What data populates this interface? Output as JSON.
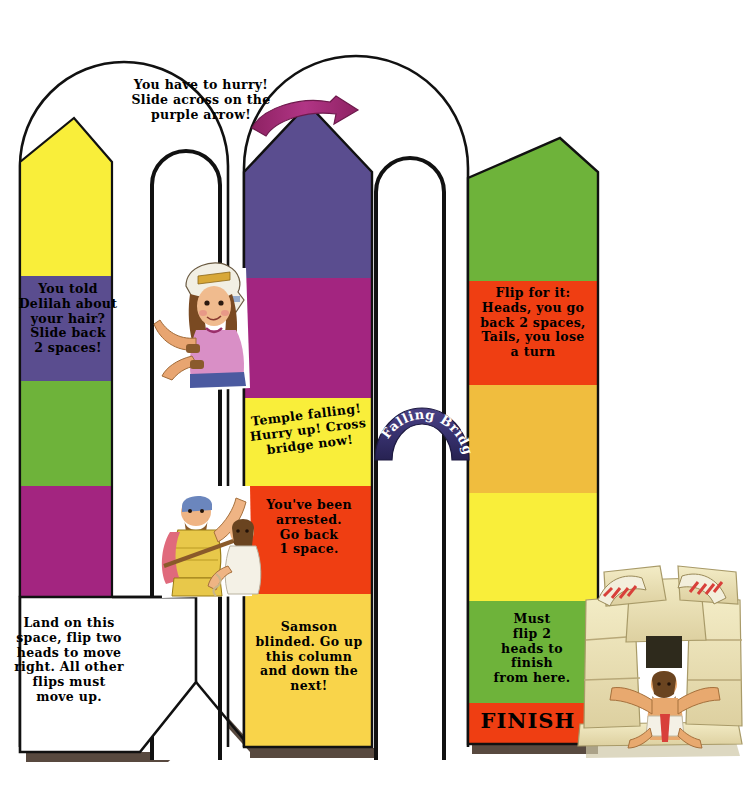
{
  "board": {
    "title": "Samson Temple Board Game",
    "background_color": "#ffffff"
  },
  "palette": {
    "yellow": "#f9ee3a",
    "purple": "#5a4d8f",
    "green": "#6eb33a",
    "magenta": "#a32580",
    "white": "#ffffff",
    "orange_red": "#ef3e12",
    "light_orange": "#f0bd3e",
    "gold": "#f9d44a",
    "bridge_navy": "#3a3474",
    "arrow_purple": "#a02a72",
    "outline": "#111111",
    "shadow": "#3b2a1e"
  },
  "annotations": {
    "hurry_note": "You have to hurry!\nSlide across on the\npurple arrow!"
  },
  "bridge": {
    "label": "Falling Bridge",
    "color": "#3a3474"
  },
  "columns": [
    {
      "name": "left-column",
      "spaces": [
        {
          "color": "#f9ee3a",
          "text": ""
        },
        {
          "color": "#5a4d8f",
          "text": "You told\nDelilah about\nyour hair?\nSlide back\n2 spaces!"
        },
        {
          "color": "#6eb33a",
          "text": ""
        },
        {
          "color": "#a32580",
          "text": ""
        },
        {
          "color": "#ffffff",
          "text": "Land on this\nspace, flip two\nheads to move\nright. All other\nflips must\nmove up."
        }
      ]
    },
    {
      "name": "middle-column",
      "spaces": [
        {
          "color": "#5a4d8f",
          "text": ""
        },
        {
          "color": "#a32580",
          "text": ""
        },
        {
          "color": "#f9ee3a",
          "text": "Temple falling!\nHurry up! Cross\nbridge now!"
        },
        {
          "color": "#ef3e12",
          "text": "You've been\narrested.\nGo back\n1 space."
        },
        {
          "color": "#f9d44a",
          "text": "Samson\nblinded. Go up\nthis column\nand down the\nnext!"
        }
      ]
    },
    {
      "name": "right-column",
      "spaces": [
        {
          "color": "#6eb33a",
          "text": ""
        },
        {
          "color": "#ef3e12",
          "text": "Flip for it:\nHeads, you go\nback 2 spaces,\nTails, you lose\na turn"
        },
        {
          "color": "#f0bd3e",
          "text": ""
        },
        {
          "color": "#f9ee3a",
          "text": ""
        },
        {
          "color": "#6eb33a",
          "text": "Must\nflip 2\nheads to\nfinish\nfrom here."
        },
        {
          "color": "#ef3e12",
          "text": "FINISH"
        }
      ]
    }
  ],
  "illustrations": [
    {
      "name": "delilah-figure",
      "caption": "Delilah character illustration"
    },
    {
      "name": "samson-arrested-figure",
      "caption": "Samson arrested by soldier illustration"
    },
    {
      "name": "samson-pillars-figure",
      "caption": "Samson pushing temple pillars illustration"
    }
  ]
}
